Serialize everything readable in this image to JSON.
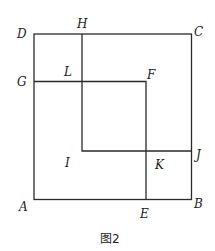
{
  "diagram": {
    "caption": "图2",
    "line_color": "#2a2a2a",
    "points": {
      "A": {
        "label": "A",
        "x": 33,
        "y": 199
      },
      "B": {
        "label": "B",
        "x": 191,
        "y": 200
      },
      "C": {
        "label": "C",
        "x": 192,
        "y": 34
      },
      "D": {
        "label": "D",
        "x": 34,
        "y": 34
      },
      "E": {
        "label": "E",
        "x": 146,
        "y": 199
      },
      "F": {
        "label": "F",
        "x": 146,
        "y": 82
      },
      "G": {
        "label": "G",
        "x": 34,
        "y": 81
      },
      "H": {
        "label": "H",
        "x": 82,
        "y": 34
      },
      "J": {
        "label": "J",
        "x": 191,
        "y": 151
      },
      "L": {
        "label": "L",
        "x": 82,
        "y": 81
      }
    },
    "region_labels": {
      "I": "I",
      "K": "K"
    },
    "segments": [
      [
        "A",
        "B"
      ],
      [
        "B",
        "C"
      ],
      [
        "C",
        "D"
      ],
      [
        "D",
        "A"
      ],
      [
        "G",
        "F"
      ],
      [
        "F",
        "E"
      ],
      [
        "H",
        "L"
      ],
      [
        "L",
        "inner_corner"
      ],
      [
        "inner_corner",
        "J"
      ]
    ]
  }
}
